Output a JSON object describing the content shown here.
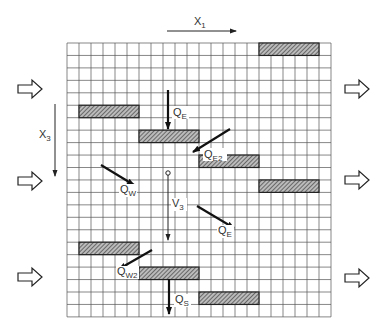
{
  "axes": {
    "x1": {
      "label": "X",
      "sub": "1"
    },
    "x3": {
      "label": "X",
      "sub": "3"
    }
  },
  "grid": {
    "cols": 22,
    "rows": 22,
    "left": 67,
    "top": 43,
    "cell_w": 12,
    "cell_h": 12.45
  },
  "blocks": [
    {
      "row": 0,
      "col": 16,
      "len": 5
    },
    {
      "row": 5,
      "col": 1,
      "len": 5
    },
    {
      "row": 7,
      "col": 6,
      "len": 5
    },
    {
      "row": 9,
      "col": 11,
      "len": 5
    },
    {
      "row": 11,
      "col": 16,
      "len": 5
    },
    {
      "row": 16,
      "col": 1,
      "len": 5
    },
    {
      "row": 18,
      "col": 6,
      "len": 5
    },
    {
      "row": 20,
      "col": 11,
      "len": 5
    }
  ],
  "flux_labels": {
    "qe_top": {
      "label": "Q",
      "sub": "E"
    },
    "qe2": {
      "label": "Q",
      "sub": "E2"
    },
    "qw": {
      "label": "Q",
      "sub": "W"
    },
    "v3": {
      "label": "V",
      "sub": "3"
    },
    "qe_mid": {
      "label": "Q",
      "sub": "E"
    },
    "qw2": {
      "label": "Q",
      "sub": "W2"
    },
    "qs": {
      "label": "Q",
      "sub": "S"
    }
  },
  "colors": {
    "grid": "#555555",
    "hatch": "#444444",
    "arrow": "#111111"
  }
}
